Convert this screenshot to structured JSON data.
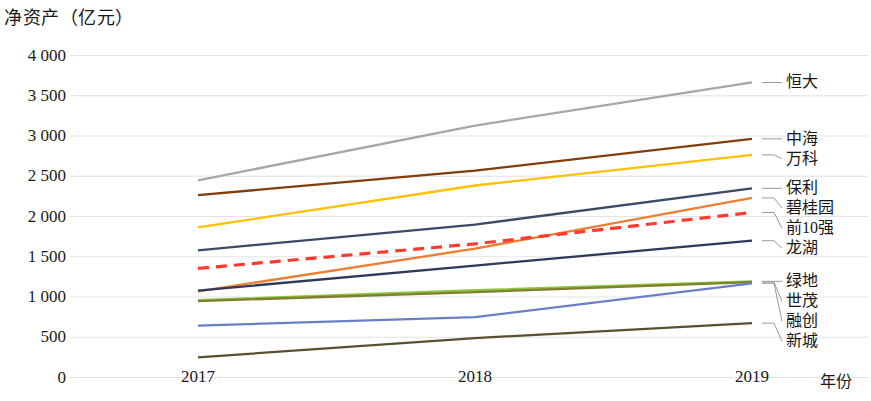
{
  "chart_data": {
    "type": "line",
    "title": "净资产（亿元）",
    "ylabel": "净资产（亿元）",
    "xlabel": "年份",
    "categories": [
      "2017",
      "2018",
      "2019"
    ],
    "x": [
      2017,
      2018,
      2019
    ],
    "ylim": [
      0,
      4000
    ],
    "ytick_labels": [
      "0",
      "500",
      "1 000",
      "1 500",
      "2 000",
      "2 500",
      "3 000",
      "3 500",
      "4 000"
    ],
    "ytick_values": [
      0,
      500,
      1000,
      1500,
      2000,
      2500,
      3000,
      3500,
      4000
    ],
    "grid": true,
    "legend_position": "right-inline-labels",
    "series": [
      {
        "name": "恒大",
        "values": [
          2450,
          3130,
          3665
        ],
        "color": "#a6a6a6",
        "style": "solid"
      },
      {
        "name": "中海",
        "values": [
          2265,
          2570,
          2965
        ],
        "color": "#843c0c",
        "style": "solid"
      },
      {
        "name": "万科",
        "values": [
          1865,
          2385,
          2765
        ],
        "color": "#ffc000",
        "style": "solid"
      },
      {
        "name": "保利",
        "values": [
          1580,
          1900,
          2350
        ],
        "color": "#3b4a66",
        "style": "solid"
      },
      {
        "name": "碧桂园",
        "values": [
          1070,
          1600,
          2230
        ],
        "color": "#ed7d31",
        "style": "solid"
      },
      {
        "name": "前10强",
        "values": [
          1355,
          1660,
          2050
        ],
        "color": "#ff3b30",
        "style": "dashed"
      },
      {
        "name": "龙湖",
        "values": [
          1080,
          1390,
          1700
        ],
        "color": "#2e3a5c",
        "style": "solid"
      },
      {
        "name": "绿地",
        "values": [
          960,
          1085,
          1195
        ],
        "color": "#8dc63f",
        "style": "solid"
      },
      {
        "name": "世茂",
        "values": [
          950,
          1060,
          1185
        ],
        "color": "#7f7f2f",
        "style": "solid"
      },
      {
        "name": "融创",
        "values": [
          645,
          750,
          1170
        ],
        "color": "#6b7fc7",
        "style": "solid"
      },
      {
        "name": "新城",
        "values": [
          250,
          490,
          675
        ],
        "color": "#595031",
        "style": "solid"
      }
    ]
  },
  "labels": {
    "y_axis_title": "净资产（亿元）",
    "x_axis_title": "年份",
    "yticks": [
      "4 000",
      "3 500",
      "3 000",
      "2 500",
      "2 000",
      "1 500",
      "1 000",
      "500",
      "0"
    ],
    "xticks": [
      "2017",
      "2018",
      "2019"
    ],
    "series_names": [
      "恒大",
      "中海",
      "万科",
      "保利",
      "碧桂园",
      "前10强",
      "龙湖",
      "绿地",
      "世茂",
      "融创",
      "新城"
    ]
  }
}
